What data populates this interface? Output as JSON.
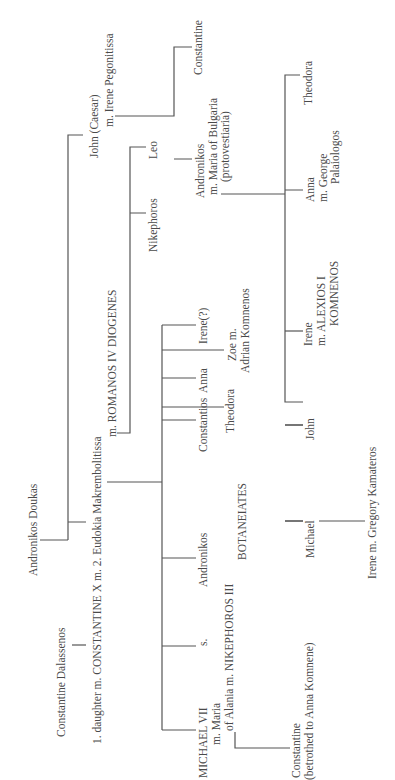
{
  "diagram": {
    "type": "genealogical-tree",
    "orientation": "rotated-90-ccw",
    "colors": {
      "text": "#4a4a4a",
      "lines": "#555555",
      "background": "#ffffff"
    },
    "people": {
      "andronikos_doukas": {
        "lines": [
          "Andronikos Doukas"
        ]
      },
      "constantine_dalassenos": {
        "lines": [
          "Constantine Dalassenos"
        ]
      },
      "constantine_x": {
        "lines": [
          "1. daughter  m. CONSTANTINE X m. 2. Eudokia Makrembolitissa",
          "m. ROMANOS IV DIOGENES"
        ]
      },
      "john_caesar": {
        "lines": [
          "John (Caesar)",
          "m. Irene Pegonitissa"
        ]
      },
      "nikephoros": {
        "lines": [
          "Nikephoros"
        ]
      },
      "leo": {
        "lines": [
          "Leo"
        ]
      },
      "andronikos_son_of_john": {
        "lines": [
          "Andronikos",
          "m. Maria of Bulgaria",
          "(protovestiaria)"
        ]
      },
      "constantine_son_of_john": {
        "lines": [
          "Constantine"
        ]
      },
      "michael_vii": {
        "lines": [
          "MICHAEL VII",
          "m. Maria",
          "of Alania m. NIKEPHOROS III",
          "BOTANEIATES"
        ]
      },
      "s": {
        "lines": [
          "s."
        ]
      },
      "andronikos_son_of_constantine": {
        "lines": [
          "Andronikos"
        ]
      },
      "constantios": {
        "lines": [
          "Constantios"
        ]
      },
      "theodora_daughter_of_constantine": {
        "lines": [
          "Theodora"
        ]
      },
      "anna_daughter_of_constantine": {
        "lines": [
          "Anna"
        ]
      },
      "zoe": {
        "lines": [
          "Zoe m.",
          "Adrian Komnenos"
        ]
      },
      "irene_q": {
        "lines": [
          "Irene(?)"
        ]
      },
      "constantine_son_of_michael": {
        "lines": [
          "Constantine",
          "(betrothed to Anna Komnene)"
        ]
      },
      "michael_son_of_andronikos": {
        "lines": [
          "Michael"
        ]
      },
      "john_son_of_andronikos": {
        "lines": [
          "John"
        ]
      },
      "irene_alexios": {
        "lines": [
          "Irene",
          "m. ALEXIOS I",
          "KOMNENOS"
        ]
      },
      "anna_palaiologos": {
        "lines": [
          "Anna",
          "m. George",
          "Palaiologos"
        ]
      },
      "theodora_daughter_of_andronikos": {
        "lines": [
          "Theodora"
        ]
      },
      "irene_kamateros": {
        "lines": [
          "Irene m. Gregory Kamateros"
        ]
      }
    }
  }
}
